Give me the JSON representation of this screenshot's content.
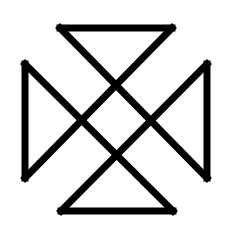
{
  "symbol": {
    "name": "cross-of-four-triangles",
    "stroke_color": "#000000",
    "background_color": "#ffffff",
    "stroke_width": 7
  }
}
